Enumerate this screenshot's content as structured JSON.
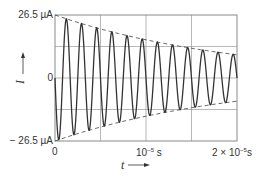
{
  "chart_data": {
    "type": "line",
    "title": "",
    "xlabel": "t",
    "ylabel": "I",
    "x_unit": "s",
    "y_unit": "µA",
    "xlim": [
      0,
      2e-05
    ],
    "ylim": [
      -26.5,
      26.5
    ],
    "x_ticks": [
      {
        "value": 0,
        "label": "0"
      },
      {
        "value": 1e-05,
        "label": "10⁻⁵ s"
      },
      {
        "value": 2e-05,
        "label": "2 × 10⁻⁵ s"
      }
    ],
    "y_ticks": [
      {
        "value": 26.5,
        "label": "26.5 µA"
      },
      {
        "value": 0,
        "label": "0"
      },
      {
        "value": -26.5,
        "label": "− 26.5 µA"
      }
    ],
    "grid": true,
    "grid_x_divisions": 4,
    "grid_y_divisions": 4,
    "series": [
      {
        "name": "current",
        "style": "solid",
        "description": "damped sinusoid I(t) = -26.5·e^(-t/τ)·sin(2πft)",
        "amplitude_uA": 26.5,
        "frequency_hz": 600000,
        "time_constant_s": 2e-05,
        "peak_times_s": [
          1.3e-06,
          2.9e-06,
          4.6e-06,
          6.3e-06,
          7.9e-06,
          9.6e-06,
          1.13e-05,
          1.29e-05,
          1.46e-05,
          1.63e-05,
          1.79e-05,
          1.96e-05
        ],
        "end_amplitude_uA": 9.8
      },
      {
        "name": "upper envelope",
        "style": "dashed",
        "x": [
          0,
          2e-05
        ],
        "values": [
          26.5,
          9.8
        ]
      },
      {
        "name": "lower envelope",
        "style": "dashed",
        "x": [
          0,
          2e-05
        ],
        "values": [
          -26.5,
          -9.8
        ]
      }
    ],
    "legend": "none"
  },
  "labels": {
    "y_top": "26.5 µA",
    "y_zero": "0",
    "y_bottom": "− 26.5 µA",
    "x_zero": "0",
    "x_mid": "10",
    "x_mid_exp": "−5",
    "x_mid_unit": " s",
    "x_end": "2 × 10",
    "x_end_exp": "−5",
    "x_end_unit": "s",
    "x_axis": "t",
    "y_axis": "I"
  },
  "colors": {
    "frame": "#8a8a8a",
    "grid": "#9a9a9a",
    "curve": "#333333",
    "envelope": "#555555"
  }
}
